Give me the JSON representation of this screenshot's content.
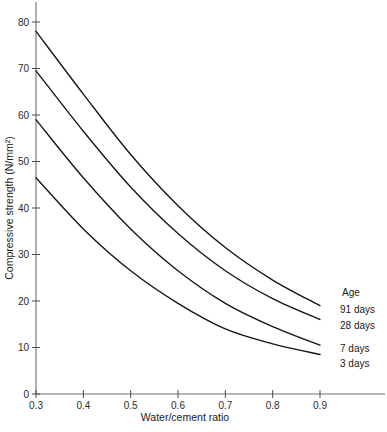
{
  "chart_data": {
    "type": "line",
    "title": "",
    "subtitle": "",
    "xlabel": "Water/cement ratio",
    "ylabel": "Compressive strength (N/mm²)",
    "xlim": [
      0.3,
      0.9
    ],
    "ylim": [
      0,
      80
    ],
    "grid": false,
    "legend_position": "right-of-curve-ends",
    "legend_title": "Age",
    "x_ticks": [
      "0.3",
      "0.4",
      "0.5",
      "0.6",
      "0.7",
      "0.8",
      "0.9"
    ],
    "x_tick_values": [
      0.3,
      0.4,
      0.5,
      0.6,
      0.7,
      0.8,
      0.9
    ],
    "y_ticks": [
      "0",
      "10",
      "20",
      "30",
      "40",
      "50",
      "60",
      "70",
      "80"
    ],
    "y_tick_values": [
      0,
      10,
      20,
      30,
      40,
      50,
      60,
      70,
      80
    ],
    "x": [
      0.3,
      0.4,
      0.5,
      0.6,
      0.7,
      0.8,
      0.9
    ],
    "series": [
      {
        "name": "91 days",
        "label": "91 days",
        "color": "#141414",
        "values": [
          78.0,
          64.5,
          51.5,
          40.5,
          31.5,
          24.5,
          19.0
        ]
      },
      {
        "name": "28 days",
        "label": "28 days",
        "color": "#141414",
        "values": [
          69.5,
          56.5,
          44.5,
          34.5,
          26.5,
          20.5,
          16.0
        ]
      },
      {
        "name": "7 days",
        "label": "7 days",
        "color": "#141414",
        "values": [
          59.0,
          46.5,
          35.5,
          26.5,
          19.5,
          14.5,
          10.5
        ]
      },
      {
        "name": "3 days",
        "label": "3 days",
        "color": "#141414",
        "values": [
          46.5,
          35.5,
          26.5,
          19.5,
          14.0,
          10.8,
          8.5
        ]
      }
    ]
  },
  "axis": {
    "x_title": "Water/cement ratio",
    "y_title": "Compressive strength (N/mm²)"
  },
  "legend": {
    "title": "Age",
    "entries": [
      "91 days",
      "28 days",
      "7 days",
      "3 days"
    ]
  }
}
